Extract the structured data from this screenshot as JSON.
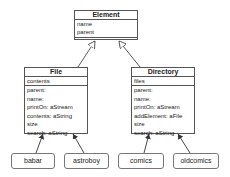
{
  "diagram": {
    "type": "uml-class-diagram",
    "classes": [
      {
        "name": "Element",
        "attributes": [
          "name",
          "parent"
        ],
        "methods": []
      },
      {
        "name": "File",
        "attributes": [
          "contents"
        ],
        "methods": [
          "parent:",
          "name:",
          "printOn: aStream",
          "contents: aString",
          "size",
          "search: aString"
        ]
      },
      {
        "name": "Directory",
        "attributes": [
          "files"
        ],
        "methods": [
          "parent:",
          "name:",
          "printOn: aStream",
          "addElement: aFile",
          "size",
          "search: aString"
        ]
      }
    ],
    "instances": [
      {
        "name": "babar",
        "instance_of": "File"
      },
      {
        "name": "astroboy",
        "instance_of": "File"
      },
      {
        "name": "comics",
        "instance_of": "Directory"
      },
      {
        "name": "oldcomics",
        "instance_of": "Directory"
      }
    ],
    "relations": [
      {
        "from": "File",
        "to": "Element",
        "kind": "inheritance"
      },
      {
        "from": "Directory",
        "to": "Element",
        "kind": "inheritance"
      },
      {
        "from": "babar",
        "to": "File",
        "kind": "instance-of"
      },
      {
        "from": "astroboy",
        "to": "File",
        "kind": "instance-of"
      },
      {
        "from": "comics",
        "to": "Directory",
        "kind": "instance-of"
      },
      {
        "from": "oldcomics",
        "to": "Directory",
        "kind": "instance-of"
      }
    ],
    "colors": {
      "line": "#555555",
      "background": "#ffffff",
      "text": "#222222"
    }
  }
}
